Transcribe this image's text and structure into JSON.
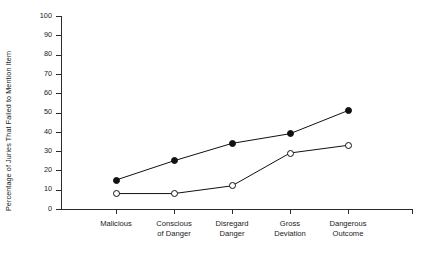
{
  "chart_data": {
    "type": "line",
    "title": "",
    "xlabel": "",
    "ylabel": "Percentage of Juries That Failed to Mention Item",
    "categories": [
      "Malicious",
      "Conscious of Danger",
      "Disregard Danger",
      "Gross Deviation",
      "Dangerous Outcome"
    ],
    "category_lines": [
      [
        "Malicious"
      ],
      [
        "Conscious",
        "of Danger"
      ],
      [
        "Disregard",
        "Danger"
      ],
      [
        "Gross",
        "Deviation"
      ],
      [
        "Dangerous",
        "Outcome"
      ]
    ],
    "ylim": [
      0,
      100
    ],
    "yticks": [
      0,
      10,
      20,
      30,
      40,
      50,
      60,
      70,
      80,
      90,
      100
    ],
    "ytick_labels": [
      "0",
      "10",
      "20",
      "30",
      "40",
      "50",
      "60",
      "70",
      "80",
      "90",
      "100"
    ],
    "grid": false,
    "legend": "none",
    "series": [
      {
        "name": "filled-circle-series",
        "marker": "filled-circle",
        "color": "#111111",
        "values": [
          15,
          25,
          34,
          39,
          51
        ]
      },
      {
        "name": "open-circle-series",
        "marker": "open-circle",
        "color": "#111111",
        "values": [
          8,
          8,
          12,
          29,
          33
        ]
      }
    ]
  }
}
